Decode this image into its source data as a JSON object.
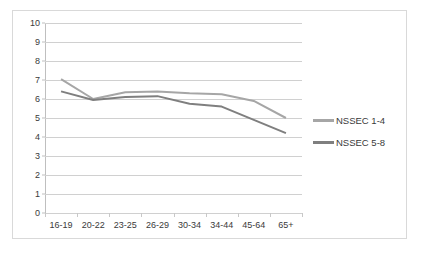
{
  "chart_data": {
    "type": "line",
    "title": "",
    "xlabel": "",
    "ylabel": "",
    "categories": [
      "16-19",
      "20-22",
      "23-25",
      "26-29",
      "30-34",
      "34-44",
      "45-64",
      "65+"
    ],
    "series": [
      {
        "name": "NSSEC 1-4",
        "color": "#a6a6a6",
        "values": [
          7.05,
          6.0,
          6.35,
          6.4,
          6.3,
          6.25,
          5.9,
          5.0
        ]
      },
      {
        "name": "NSSEC 5-8",
        "color": "#7f7f7f",
        "values": [
          6.4,
          5.95,
          6.1,
          6.15,
          5.75,
          5.6,
          4.9,
          4.2
        ]
      }
    ],
    "ylim": [
      0,
      10
    ],
    "ytick_labels": [
      "0",
      "1",
      "2",
      "3",
      "4",
      "5",
      "6",
      "7",
      "8",
      "9",
      "10"
    ],
    "ytick_values": [
      0,
      1,
      2,
      3,
      4,
      5,
      6,
      7,
      8,
      9,
      10
    ],
    "grid": true,
    "grid_color": "#d0d0d0",
    "legend_position": "right",
    "plot_background": "#ffffff",
    "border_color": "#d9d9d9"
  }
}
